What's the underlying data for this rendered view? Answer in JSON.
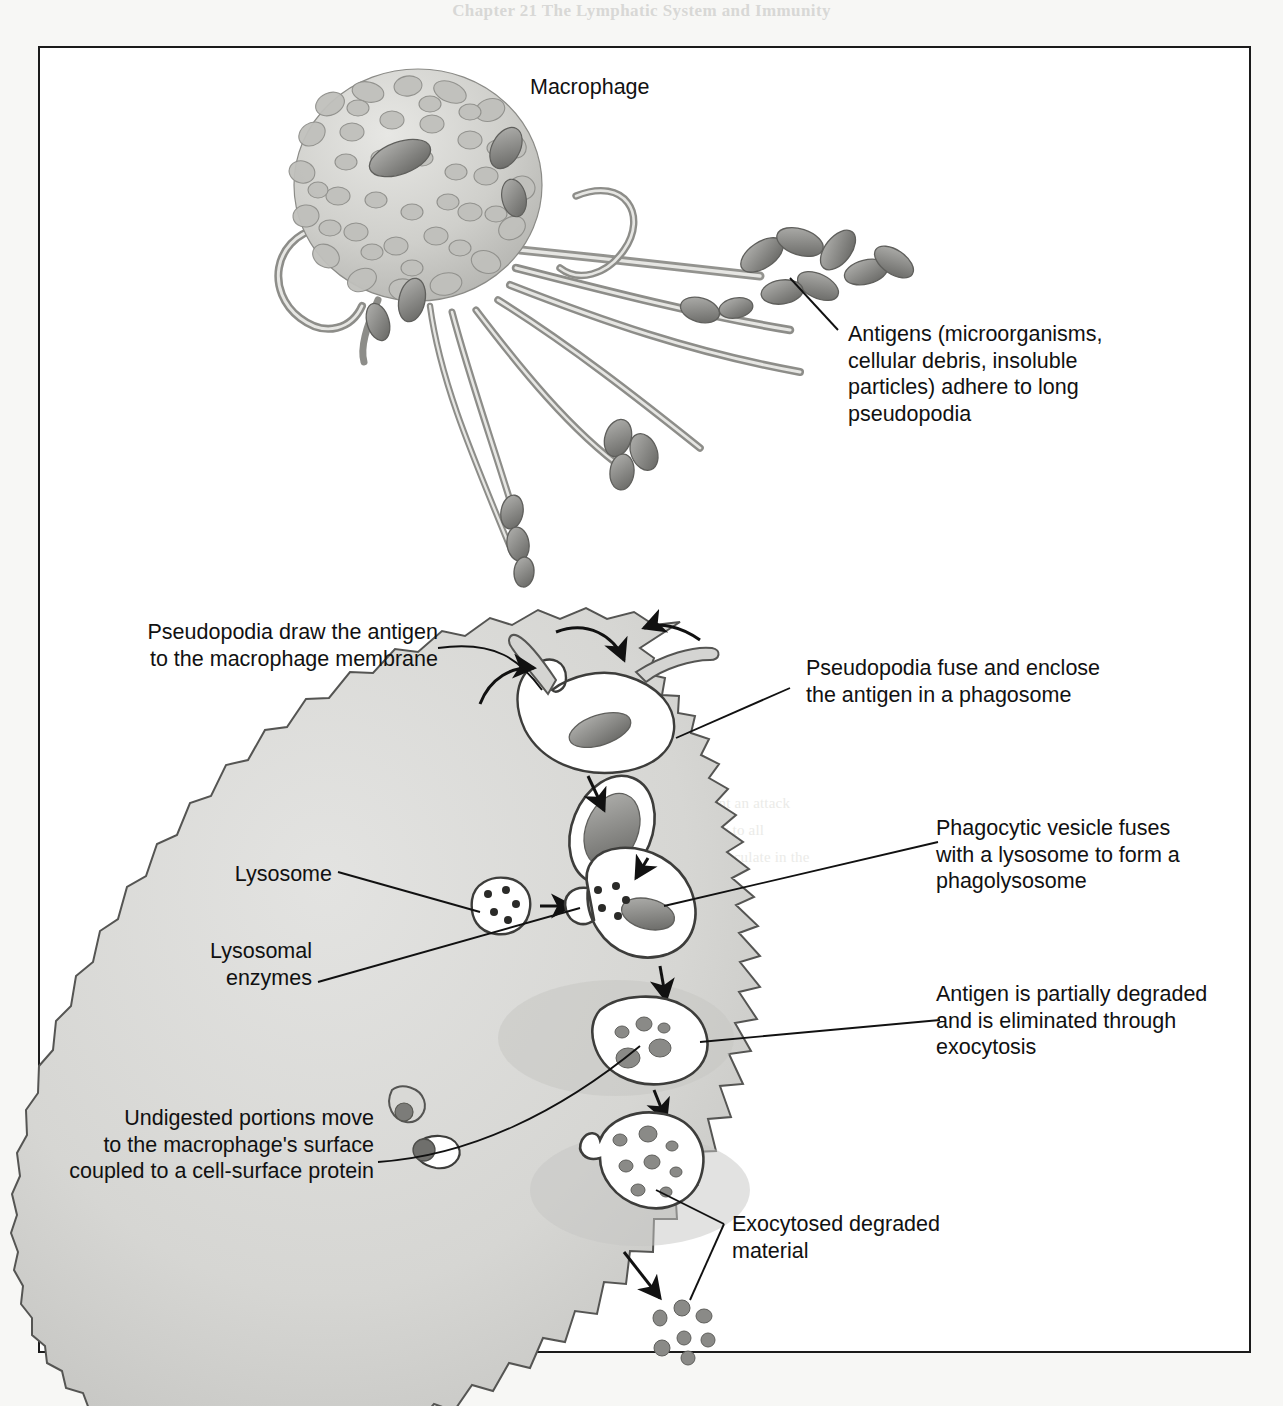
{
  "page": {
    "running_header": "Chapter 21    The Lymphatic System and Immunity",
    "background_color": "#f7f7f5",
    "frame_border_color": "#1b1b1b"
  },
  "figure": {
    "panels": [
      {
        "id": "upper",
        "name": "macrophage-with-pseudopodia"
      },
      {
        "id": "lower",
        "name": "phagocytosis-sequence-inside-macrophage"
      }
    ]
  },
  "labels": {
    "macrophage": "Macrophage",
    "antigens_adhere": "Antigens (microorganisms,\ncellular debris, insoluble\nparticles) adhere to long\npseudopodia",
    "pseudopodia_draw": "Pseudopodia draw the antigen\nto the macrophage membrane",
    "pseudopodia_fuse": "Pseudopodia fuse and enclose\nthe antigen in a phagosome",
    "phagocytic_vesicle": "Phagocytic vesicle fuses\nwith a lysosome to form a\nphagolysosome",
    "lysosome": "Lysosome",
    "lysosomal_enzymes": "Lysosomal\nenzymes",
    "antigen_degraded": "Antigen is partially degraded\nand is eliminated through\nexocytosis",
    "undigested_portions": "Undigested portions move\nto the macrophage's surface\ncoupled to a cell-surface protein",
    "exocytosed_material": "Exocytosed degraded\nmaterial"
  },
  "colors": {
    "cytoplasm": "#d4d4d2",
    "cell_outline": "#3a3a3a",
    "vesicle_fill": "#ffffff",
    "antigen_fill": "#8e8e8c",
    "leader_line": "#111111",
    "text": "#111111"
  },
  "structures": {
    "upper_panel": {
      "cell_body": "ruffled membrane macrophage",
      "pseudopodia_count": 9,
      "antigen_clusters": [
        "upper-right cluster",
        "mid pseudopodium",
        "lower pseudopodium",
        "lower-left rod"
      ]
    },
    "lower_panel": {
      "steps": [
        "pseudopodia engulf antigen",
        "phagosome with antigen",
        "lysosome fuses with phagosome",
        "phagolysosome with lysosomal enzymes",
        "antigen partially degraded in vesicle",
        "vesicle moves to surface and exocytoses",
        "exocytosed degraded material released"
      ],
      "lysosome_enzyme_dots": 5,
      "exocytosed_fragment_count": 7
    }
  }
}
